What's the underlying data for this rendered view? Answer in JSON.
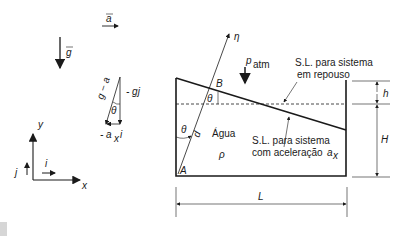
{
  "vectors": {
    "acceleration": "a",
    "gravity": "g",
    "g_minus_a": "g − a",
    "minus_g_j": "- gj",
    "minus_ax_i": "- a",
    "ax_sub": "x",
    "i_unit": "i",
    "theta": "θ"
  },
  "axes": {
    "y_label": "y",
    "x_label": "x",
    "j_unit": "j",
    "i_unit": "i"
  },
  "tank": {
    "eta_label": "η",
    "point_B": "B",
    "point_A": "A",
    "theta_top": "θ",
    "theta_bottom": "θ",
    "d_label": "d",
    "fluid_label": "Água",
    "density_label": "ρ",
    "patm_p": "p",
    "patm_sub": "atm",
    "rest_surface_line1": "S.L. para sistema",
    "rest_surface_line2": "em repouso",
    "accel_surface_line1": "S.L. para sistema",
    "accel_surface_line2": "com aceleração",
    "accel_symbol": "a",
    "accel_sub": "x",
    "h_label": "h",
    "H_label": "H",
    "L_label": "L"
  },
  "colors": {
    "line": "#1a1a1a",
    "background": "#ffffff"
  }
}
